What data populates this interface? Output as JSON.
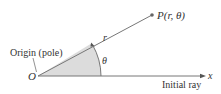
{
  "diagram": {
    "point_label": "P(r, θ)",
    "radius_label": "r",
    "angle_label": "θ",
    "origin_letter": "O",
    "origin_label": "Origin (pole)",
    "axis_label": "x",
    "ray_label": "Initial ray",
    "colors": {
      "line": "#777777",
      "sector_fill": "#d9d9d9",
      "text": "#333333"
    }
  }
}
